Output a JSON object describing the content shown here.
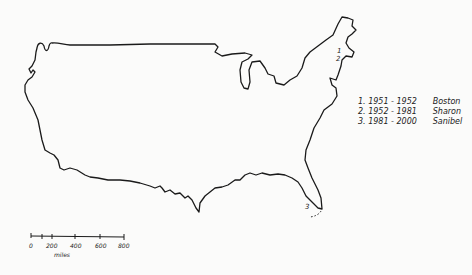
{
  "map": {
    "subject": "Outline map of the contiguous United States",
    "markers": [
      {
        "label": "1",
        "x": 340,
        "y": 52
      },
      {
        "label": "2",
        "x": 337,
        "y": 60
      },
      {
        "label": "3",
        "x": 307,
        "y": 208
      }
    ]
  },
  "legend": {
    "entries": [
      {
        "number": "1.",
        "years": "1951 - 1952",
        "place": "Boston"
      },
      {
        "number": "2.",
        "years": "1952 - 1981",
        "place": "Sharon"
      },
      {
        "number": "3.",
        "years": "1981 - 2000",
        "place": "Sanibel"
      }
    ]
  },
  "scale_bar": {
    "ticks": [
      "0",
      "200",
      "400",
      "600",
      "800"
    ],
    "unit": "miles"
  }
}
